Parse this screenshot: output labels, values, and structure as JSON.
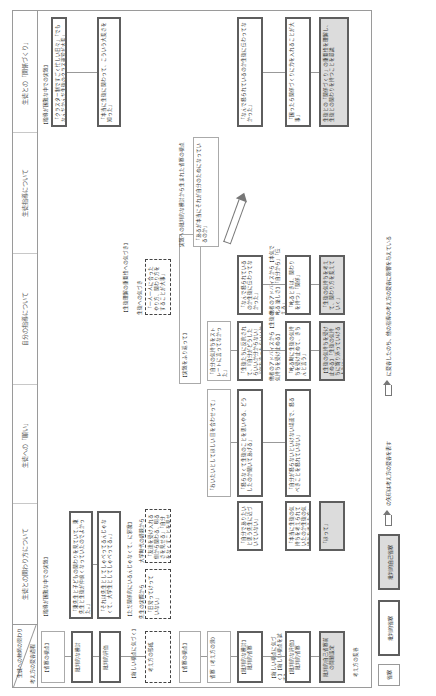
{
  "header": {
    "corner_top": "生徒への教師の関わり",
    "corner_bottom": "考え方の変容過程",
    "columns": [
      "生徒との関わり方について",
      "生徒への「願い」",
      "自分の指導について",
      "生徒指導について",
      "生徒との「関係づくり」"
    ]
  },
  "rows": [
    {
      "label": "【省察の視点】",
      "style": "plain"
    },
    {
      "label": "批判的な検討",
      "style": "crit"
    },
    {
      "label": "批判的評価",
      "style": "crit"
    },
    {
      "label": "【新しい視点に気づく】",
      "style": "text"
    },
    {
      "label": "考え方の形成",
      "style": "dash"
    },
    {
      "label": "【省察の視点】",
      "style": "plain"
    },
    {
      "label": "省察（考え方の源）",
      "style": "plain"
    },
    {
      "label": "【批判的な検討】批判的省察",
      "style": "crit"
    },
    {
      "label": "【新しい視点に気づく】【新しい視点を試す】",
      "style": "text"
    },
    {
      "label": "【批判的な評価】批判的省察",
      "style": "crit"
    },
    {
      "label": "批判的自己省察前の問題設定",
      "style": "self"
    },
    {
      "label": "考え方の変容",
      "style": "text"
    }
  ],
  "blocks": {
    "c1_reflect": "【指導が困難な中での実践】",
    "c1_r1": "「東先生と子どもの関わりを見ていて、東先生と生徒が仲良くなっていたのでよかった。」",
    "c1_r2": "「それは先生としてしゃべってるんじゃなくて、大学生としてしゃべってる。」",
    "c1_newview": "【ただ関係的にいるんじゃなくて、に邪魔】",
    "c1_form_label": "先生の実際から",
    "c1_form": "「日常ってけっていない」",
    "c1_form2_label": "大学時代の経験から",
    "c1_form2": "「友達を受け入れる側から関わる、明るさを見せる」「自分をなくすことを見せる」",
    "c2_top": "「おいたいとしてほしい 目を合わせって」",
    "c2_mid": "「ほって」",
    "c2_r1": "「怒らなくて生徒のことを思いやる、どうしたのか聞いてあげる」",
    "c2_r2": "「自分が怒らないといけない場面で、怒るべきことを怒れていない」",
    "c2_r3": "「自分でありたいと思う先生に近づいていない」",
    "c2_r4": "「本当に生徒の気持ちを考えられていたのか生徒の気持ちを考えた方」",
    "c3_top": "【実践をふり返って】",
    "c3_r1": "「自分の気持ちをストレートに言ってなかった」",
    "c3_r2": "「生徒たちに反抗されて、『自分がどうしたらいいか分からない』『何を言ったらいいか分からない』」",
    "c3_advice": "他者のアドバイスから【生徒の気持ちを受け止める】",
    "c3_r3": "「叱る時に生徒の気持ちを受け止めて、きちんと言う」",
    "c3_self": "【生徒の気持ちを受け止める】「生徒の気持ちに寄り添っていけるように」",
    "c4_reflect": "【生徒理解の重要性への気づき】",
    "c4_form_label": "生徒への気づき",
    "c4_form": "「一人一人に合ったやり方、関わり方をすることが大事」",
    "c4_r1": "「なんで怒られているのか生徒に伝わってなかった」",
    "c4_advice": "他者のアドバイスから【本気で叱る 楽しさ】「自分から」「伝える」",
    "c4_r2": "「叱るときは、関わりを持つ」「関係」",
    "c4_self": "「生徒の気持ちを考えて、関わり方を変えていく」",
    "c5_reflect": "【指導が困難な中での実践】",
    "c5_r1": "「クラスター制ですごく忙しい日々」「でもなんだかんだ生徒のクラス運営が大変」",
    "c5_r2": "「本当に生徒に関わって、こういう大変さを知った」",
    "c5_pre": "実践への批判的な検討から生まれた省察の視点",
    "c5_pre2": "「あるが本当にそれが自分のためになっているのか」",
    "c5_r3": "「なんで怒られているのか生徒に伝わってなかった」",
    "c5_r4": "「困ったら関係づくりに力を入れることが大事」",
    "c5_self": "生徒との「関係づくり」の重要性を理解し、生徒との関わりを持つことを意識"
  },
  "legend": {
    "items": [
      {
        "label": "省察",
        "style": "plain"
      },
      {
        "label": "批判的省察",
        "style": "crit"
      },
      {
        "label": "批判的自己省察",
        "style": "self"
      }
    ],
    "arrow_label": "の矢印は考え方の変容を表す",
    "note": "に変容したのち、他の指導の考え方の変容に影響を与えている"
  },
  "colors": {
    "border": "#5e5e5e",
    "self_fill": "#dcdcdc",
    "rule": "#9a9a9a"
  }
}
